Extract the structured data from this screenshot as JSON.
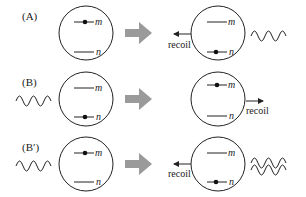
{
  "panels": [
    {
      "label": "(A)",
      "before": {
        "occupied": "m",
        "incoming_wave": "none"
      },
      "after": {
        "occupied": "n",
        "recoil": "left",
        "outgoing_wave": "single"
      }
    },
    {
      "label": "(B)",
      "before": {
        "occupied": "n",
        "incoming_wave": "single"
      },
      "after": {
        "occupied": "m",
        "recoil": "right",
        "outgoing_wave": "none"
      }
    },
    {
      "label": "(B′)",
      "before": {
        "occupied": "m",
        "incoming_wave": "single"
      },
      "after": {
        "occupied": "n",
        "recoil": "left",
        "outgoing_wave": "double"
      }
    }
  ],
  "level_labels": {
    "upper": "m",
    "lower": "n"
  },
  "recoil_label": "recoil",
  "colors": {
    "line": "#222222",
    "process_arrow": "#9a9a9a"
  }
}
